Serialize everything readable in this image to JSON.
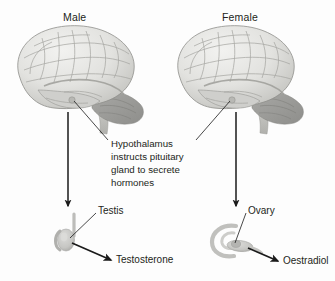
{
  "figure": {
    "background_color": "#fdfdfd",
    "text_color": "#231f20",
    "brain_colors": {
      "cortex_light": "#e9e9e7",
      "cortex_mid": "#d2d2cf",
      "cortex_shadow": "#b6b6b2",
      "cerebellum": "#9b9b98",
      "brainstem": "#c4c4c0",
      "outline": "#8e8e8a"
    },
    "organ_colors": {
      "fill": "#c9c9c6",
      "shadow": "#aeaeaa",
      "highlight": "#dedede"
    },
    "arrow_color": "#1a1a1a"
  },
  "columns": {
    "male": {
      "sex_label": "Male",
      "organ_label": "Testis",
      "hormone_label": "Testosterone"
    },
    "female": {
      "sex_label": "Female",
      "organ_label": "Ovary",
      "hormone_label": "Oestradiol"
    }
  },
  "center_note": {
    "text": "Hypothalamus instructs pituitary gland to secrete hormones",
    "lines": [
      "Hypothalamus",
      "instructs pituitary",
      "gland to secrete",
      "hormones"
    ]
  },
  "annotations": {
    "brain_region_pointed": "hypothalamus",
    "male_axis_arrow": "brain to testis",
    "female_axis_arrow": "brain to ovary",
    "male_secretion_arrow": "testis to testosterone",
    "female_secretion_arrow": "ovary to oestradiol"
  }
}
